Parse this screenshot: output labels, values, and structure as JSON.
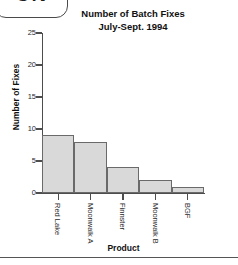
{
  "badge": {
    "text": "ON",
    "note": "clipped rounded tab at top-left"
  },
  "chart_data": {
    "type": "bar",
    "title": "Number of Batch Fixes",
    "subtitle": "July-Sept. 1994",
    "xlabel": "Product",
    "ylabel": "Number of Fixes",
    "categories": [
      "Red Lake",
      "Moonwalk A",
      "Finnster",
      "Moonwalk B",
      "BGF"
    ],
    "values": [
      9,
      8,
      4,
      2,
      1
    ],
    "ylim": [
      0,
      25
    ],
    "yticks": [
      0,
      5,
      10,
      15,
      20,
      25
    ],
    "ytick_labels": [
      "0",
      "5",
      "10",
      "15",
      "20",
      "25"
    ],
    "grid": false,
    "legend": false,
    "bar_fill": "#d9d9d9",
    "bar_stroke": "#6a6a6a",
    "axis_color": "#4d4d4d"
  }
}
